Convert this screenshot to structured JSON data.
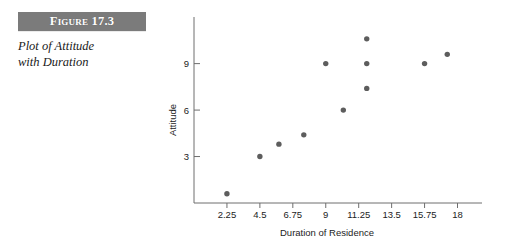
{
  "figure": {
    "banner_label": "Figure 17.3",
    "caption_line1": "Plot of Attitude",
    "caption_line2": "with Duration",
    "banner_color": "#7b7b7b",
    "banner_text_color": "#ffffff"
  },
  "chart_data": {
    "type": "scatter",
    "title": "",
    "xlabel": "Duration of Residence",
    "ylabel": "Attitude",
    "xlim": [
      0,
      19.4
    ],
    "ylim": [
      0,
      11.3
    ],
    "grid": false,
    "legend": null,
    "marker_color": "#5d5d5d",
    "axis_color": "#6e6e6e",
    "xticks": [
      2.25,
      4.5,
      6.75,
      9,
      11.25,
      13.5,
      15.75,
      18
    ],
    "xtick_labels": [
      "2.25",
      "4.5",
      "6.75",
      "9",
      "11.25",
      "13.5",
      "15.75",
      "18"
    ],
    "yticks": [
      3,
      6,
      9
    ],
    "ytick_labels": [
      "3",
      "6",
      "9"
    ],
    "points": [
      {
        "x": 2.25,
        "y": 0.6
      },
      {
        "x": 4.5,
        "y": 3.0
      },
      {
        "x": 5.8,
        "y": 3.8
      },
      {
        "x": 7.5,
        "y": 4.4
      },
      {
        "x": 9.0,
        "y": 9.0
      },
      {
        "x": 10.2,
        "y": 6.0
      },
      {
        "x": 11.8,
        "y": 10.6
      },
      {
        "x": 11.8,
        "y": 9.0
      },
      {
        "x": 11.8,
        "y": 7.4
      },
      {
        "x": 15.75,
        "y": 9.0
      },
      {
        "x": 17.3,
        "y": 9.6
      }
    ]
  }
}
